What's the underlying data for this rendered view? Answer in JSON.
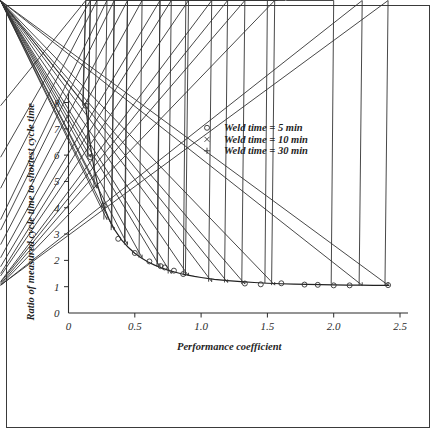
{
  "figure": {
    "background_color": "#ffffff",
    "frame_color": "#3a3a3a"
  },
  "chart_data": {
    "type": "scatter",
    "title": "",
    "xlabel": "Performance coefficient",
    "ylabel": "Ratio of measured cycle time to shortest cycle time",
    "xlim": [
      0,
      2.5
    ],
    "ylim": [
      0,
      8
    ],
    "xticks": [
      0,
      0.5,
      1.0,
      1.5,
      2.0,
      2.5
    ],
    "xtick_labels": [
      "0",
      "0.5",
      "1.0",
      "1.5",
      "2.0",
      "2.5"
    ],
    "yticks": [
      0,
      1,
      2,
      3,
      4,
      5,
      6,
      7,
      8
    ],
    "ytick_labels": [
      "0",
      "1",
      "2",
      "3",
      "4",
      "5",
      "6",
      "7",
      "8"
    ],
    "grid": false,
    "legend_position": "upper-right-inside",
    "fit_curve": {
      "name": "fitted curve",
      "x": [
        0.13,
        0.15,
        0.17,
        0.19,
        0.22,
        0.25,
        0.28,
        0.31,
        0.35,
        0.4,
        0.45,
        0.5,
        0.55,
        0.6,
        0.65,
        0.7,
        0.75,
        0.8,
        0.85,
        0.9,
        0.95,
        1.0,
        1.1,
        1.2,
        1.3,
        1.4,
        1.5,
        1.6,
        1.7,
        1.8,
        1.9,
        2.0,
        2.1,
        2.2,
        2.3,
        2.42
      ],
      "y": [
        7.88,
        6.95,
        6.2,
        5.58,
        4.86,
        4.3,
        3.88,
        3.52,
        3.15,
        2.78,
        2.5,
        2.27,
        2.09,
        1.94,
        1.82,
        1.72,
        1.63,
        1.56,
        1.49,
        1.44,
        1.39,
        1.35,
        1.28,
        1.23,
        1.19,
        1.16,
        1.13,
        1.11,
        1.1,
        1.09,
        1.08,
        1.07,
        1.06,
        1.06,
        1.05,
        1.05
      ]
    },
    "series": [
      {
        "name": "Weld time = 5 min",
        "marker": "circle",
        "marker_symbol": "o",
        "x": [
          0.13,
          0.165,
          0.265,
          0.375,
          0.5,
          0.61,
          0.695,
          0.725,
          0.795,
          0.865,
          1.33,
          1.45,
          1.605,
          1.78,
          1.88,
          2.0,
          2.12,
          2.41
        ],
        "y": [
          7.88,
          5.92,
          4.08,
          2.82,
          2.28,
          1.96,
          1.78,
          1.73,
          1.61,
          1.48,
          1.12,
          1.09,
          1.13,
          1.08,
          1.07,
          1.05,
          1.05,
          1.06
        ]
      },
      {
        "name": "Weld time = 10 min",
        "marker": "cross",
        "marker_symbol": "x",
        "x": [
          0.13,
          0.165,
          0.345,
          0.445,
          0.69,
          0.885,
          1.5,
          2.0
        ],
        "y": [
          7.88,
          5.92,
          3.15,
          2.6,
          1.75,
          1.34,
          1.04,
          1.02
        ]
      },
      {
        "name": "Weld time = 30 min",
        "marker": "plus",
        "marker_symbol": "+",
        "x": [
          0.13,
          0.165,
          0.215,
          0.29,
          0.345,
          0.445,
          0.555,
          0.69,
          0.775,
          0.905,
          1.08,
          1.2,
          1.33,
          1.555,
          2.215,
          2.41
        ],
        "y": [
          7.88,
          5.92,
          4.74,
          3.55,
          3.15,
          2.6,
          2.1,
          1.76,
          1.5,
          1.41,
          1.19,
          1.16,
          1.1,
          1.06,
          1.05,
          1.06
        ]
      }
    ],
    "legend": [
      {
        "marker_symbol": "o",
        "label": "Weld time = 5 min"
      },
      {
        "marker_symbol": "x",
        "label": "Weld time = 10 min"
      },
      {
        "marker_symbol": "+",
        "label": "Weld time = 30 min"
      }
    ]
  }
}
